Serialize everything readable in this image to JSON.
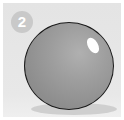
{
  "step": {
    "number": "2"
  },
  "illustration": {
    "subject": "shaded sphere with highlight and cast shadow",
    "colors": {
      "background": "#e6e6e6",
      "sphere": "#9a9a9a",
      "outline": "#1a1a1a",
      "highlight": "#ffffff",
      "shadow": "#cfcfcf",
      "badge": "#c9c9c9"
    }
  }
}
